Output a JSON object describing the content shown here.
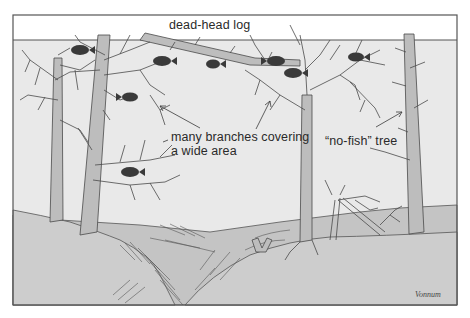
{
  "diagram": {
    "type": "illustration",
    "frame": {
      "x": 13,
      "y": 15,
      "width": 444,
      "height": 290,
      "border_color": "#555555"
    },
    "water_surface_y": 40,
    "colors": {
      "water": "#e9e9e9",
      "air": "#ffffff",
      "bottom_far": "#c4c4c4",
      "bottom_near": "#cdcdcd",
      "trunk": "#bdbdbd",
      "line": "#4a4a4a",
      "fish": "#3a3a3a"
    },
    "labels": {
      "log": "dead-head log",
      "branches_line1": "many branches covering",
      "branches_line2": "a wide area",
      "nofish": "“no-fish” tree"
    },
    "signature": "Vonnum",
    "elements": [
      {
        "name": "dead-head log",
        "kind": "log"
      },
      {
        "name": "branchy tree left",
        "kind": "tree"
      },
      {
        "name": "branchy tree center-left",
        "kind": "tree"
      },
      {
        "name": "branchy tree center-right",
        "kind": "tree"
      },
      {
        "name": "no-fish tree",
        "kind": "tree"
      },
      {
        "name": "fallen snag",
        "kind": "snag"
      },
      {
        "name": "stump",
        "kind": "stump"
      },
      {
        "name": "crappie fish",
        "kind": "fish",
        "count": 7
      }
    ]
  }
}
